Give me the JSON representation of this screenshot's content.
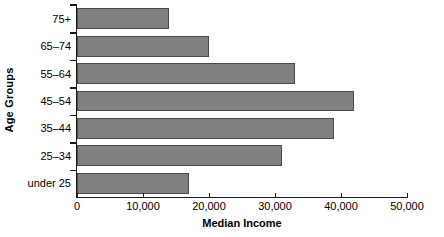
{
  "chart_data": {
    "type": "bar",
    "orientation": "horizontal",
    "title": "",
    "xlabel": "Median Income",
    "ylabel": "Age Groups",
    "categories": [
      "under 25",
      "25–34",
      "35–44",
      "45–54",
      "55–64",
      "65–74",
      "75+"
    ],
    "values": [
      17000,
      31000,
      39000,
      42000,
      33000,
      20000,
      14000
    ],
    "xlim": [
      0,
      50000
    ],
    "xticks": [
      0,
      10000,
      20000,
      30000,
      40000,
      50000
    ],
    "xtick_labels": [
      "0",
      "10,000",
      "20,000",
      "30,000",
      "40,000",
      "50,000"
    ],
    "grid": false,
    "legend": false,
    "bar_color": "#808080",
    "bar_edge_color": "#4a4a4a",
    "axis_color": "#1a1a1a",
    "background_color": "#ffffff"
  }
}
